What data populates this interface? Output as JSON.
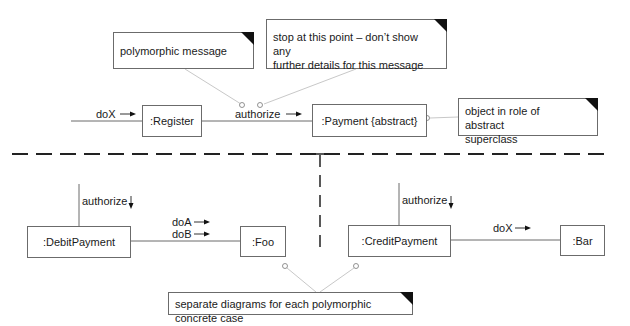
{
  "diagram": {
    "type": "UML communication diagram",
    "objects": {
      "register": ":Register",
      "payment": ":Payment {abstract}",
      "debit_payment": ":DebitPayment",
      "foo": ":Foo",
      "credit_payment": ":CreditPayment",
      "bar": ":Bar"
    },
    "messages": {
      "top_dox": "doX",
      "top_authorize": "authorize",
      "debit_authorize": "authorize",
      "doa": "doA",
      "dob": "doB",
      "credit_authorize": "authorize",
      "credit_dox": "doX"
    },
    "notes": {
      "polymorphic": "polymorphic message",
      "stop_line1": "stop at this point – don’t show any",
      "stop_line2": "further details for this message",
      "abstract_line1": "object in role of abstract",
      "abstract_line2": "superclass",
      "separate": "separate diagrams for each polymorphic concrete case"
    },
    "arrows": {
      "right": "→",
      "down": "↓"
    },
    "colors": {
      "line": "#6b6b6b",
      "connector": "#c8c8c8",
      "text": "#1a1a1a",
      "fold": "#111111"
    }
  }
}
